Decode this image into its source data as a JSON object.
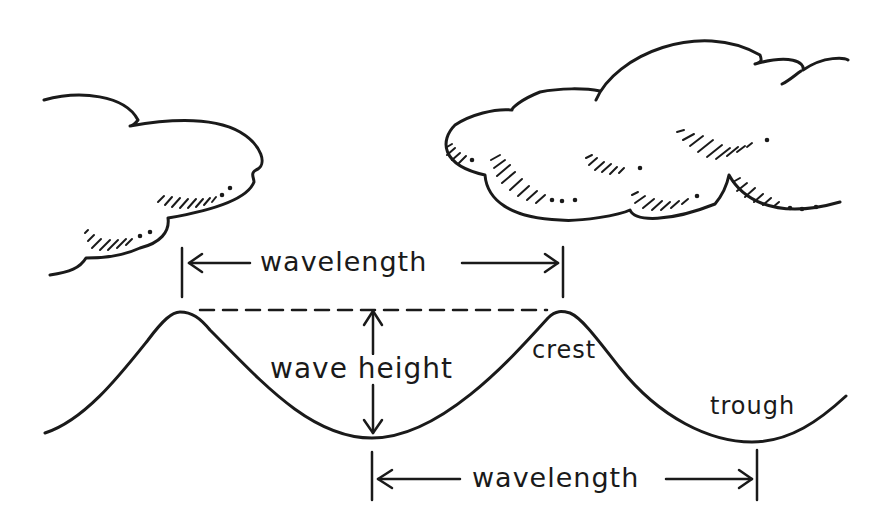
{
  "diagram": {
    "ink_color": "#1a1a1a",
    "background": "#ffffff",
    "labels": {
      "wavelength_top": "wavelength",
      "wave_height": "wave height",
      "crest": "crest",
      "trough": "trough",
      "wavelength_bottom": "wavelength"
    },
    "elements": [
      {
        "type": "cloud",
        "position": "upper-left",
        "shaded": true
      },
      {
        "type": "cloud",
        "position": "upper-right",
        "shaded": true
      },
      {
        "type": "wave",
        "crests": 2,
        "troughs": 2
      },
      {
        "type": "dimension-arrow",
        "label": "wavelength",
        "span": "crest-to-crest"
      },
      {
        "type": "dashed-line",
        "span": "crest-to-crest"
      },
      {
        "type": "dimension-arrow",
        "label": "wave height",
        "span": "crest-to-trough",
        "orientation": "vertical"
      },
      {
        "type": "dimension-arrow",
        "label": "wavelength",
        "span": "trough-to-trough"
      }
    ]
  }
}
